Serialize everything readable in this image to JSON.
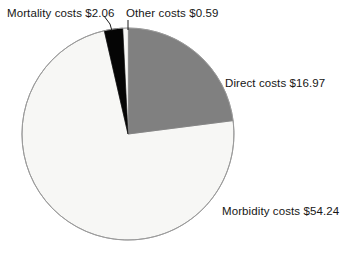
{
  "chart_data": {
    "type": "pie",
    "title": "",
    "subtitle": "",
    "xlabel": "",
    "ylabel": "",
    "grid": false,
    "legend_position": "none",
    "labels_placement": "outside-with-leader-lines",
    "start_angle_deg": 0,
    "direction": "clockwise",
    "units": "US dollars (billions)",
    "total": 73.86,
    "categories": [
      "Direct costs",
      "Morbidity costs",
      "Mortality costs",
      "Other costs"
    ],
    "values": [
      16.97,
      54.24,
      2.06,
      0.59
    ],
    "slices": [
      {
        "name": "Direct costs",
        "value": 16.97,
        "value_text": "$16.97",
        "label": "Direct costs $16.97",
        "color": "#808080",
        "angle_deg": 82.7,
        "percent": 23.0
      },
      {
        "name": "Morbidity costs",
        "value": 54.24,
        "value_text": "$54.24",
        "label": "Morbidity costs $54.24",
        "color": "#f7f7f5",
        "angle_deg": 264.4,
        "percent": 73.4
      },
      {
        "name": "Mortality costs",
        "value": 2.06,
        "value_text": "$2.06",
        "label": "Mortality costs $2.06",
        "color": "#050505",
        "angle_deg": 10.0,
        "percent": 2.8
      },
      {
        "name": "Other costs",
        "value": 0.59,
        "value_text": "$0.59",
        "label": "Other costs $0.59",
        "color": "#f7f7f5",
        "angle_deg": 2.9,
        "percent": 0.8
      }
    ]
  },
  "labels": {
    "mortality": "Mortality costs $2.06",
    "other": "Other costs $0.59",
    "direct": "Direct costs $16.97",
    "morbidity": "Morbidity costs $54.24"
  },
  "colors": {
    "background": "#ffffff",
    "direct_slice": "#808080",
    "morbidity_slice": "#f7f7f5",
    "mortality_slice": "#050505",
    "other_slice": "#f7f7f5",
    "slice_outline": "#9a9a9a",
    "leader_line": "#1a1a1a",
    "text": "#161616"
  },
  "geometry": {
    "center_x": 128,
    "center_y": 134,
    "radius": 106
  }
}
